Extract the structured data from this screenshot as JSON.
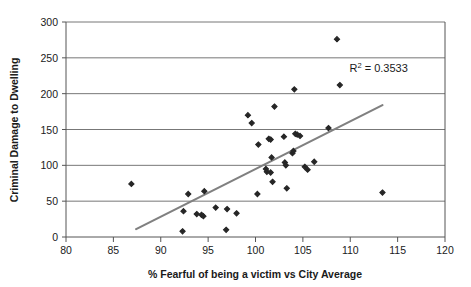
{
  "chart_data": {
    "type": "scatter",
    "title": "",
    "xlabel": "% Fearful of being a victim vs City Average",
    "ylabel": "Criminal Damage to Dwelling",
    "xlim": [
      80,
      120
    ],
    "ylim": [
      0,
      300
    ],
    "xticks": [
      80,
      85,
      90,
      95,
      100,
      105,
      110,
      115,
      120
    ],
    "yticks": [
      0,
      50,
      100,
      150,
      200,
      250,
      300
    ],
    "grid": "horizontal",
    "legend": "none",
    "annotations": [
      {
        "name": "r-squared",
        "text": "R2 = 0.3533",
        "display_prefix": "R",
        "display_sup": "2",
        "display_suffix": " = 0.3533",
        "value": 0.3533,
        "x": 113.0,
        "y": 230
      }
    ],
    "series": [
      {
        "name": "Wards",
        "marker": "diamond",
        "color": "#262626",
        "points": [
          [
            86.9,
            74
          ],
          [
            92.3,
            8
          ],
          [
            92.4,
            36
          ],
          [
            92.9,
            60
          ],
          [
            93.8,
            32
          ],
          [
            94.3,
            31
          ],
          [
            94.5,
            29
          ],
          [
            94.6,
            64
          ],
          [
            95.8,
            41
          ],
          [
            96.9,
            10
          ],
          [
            97.0,
            39
          ],
          [
            98.0,
            33
          ],
          [
            99.2,
            170
          ],
          [
            99.6,
            159
          ],
          [
            100.2,
            60
          ],
          [
            100.3,
            129
          ],
          [
            101.1,
            95
          ],
          [
            101.2,
            91
          ],
          [
            101.4,
            137
          ],
          [
            101.6,
            136
          ],
          [
            101.6,
            90
          ],
          [
            101.7,
            111
          ],
          [
            101.8,
            77
          ],
          [
            102.0,
            182
          ],
          [
            103.0,
            140
          ],
          [
            103.1,
            104
          ],
          [
            103.2,
            100
          ],
          [
            103.3,
            68
          ],
          [
            103.9,
            117
          ],
          [
            104.0,
            120
          ],
          [
            104.1,
            206
          ],
          [
            104.2,
            144
          ],
          [
            104.4,
            143
          ],
          [
            104.7,
            141
          ],
          [
            105.2,
            98
          ],
          [
            105.5,
            94
          ],
          [
            106.2,
            105
          ],
          [
            107.7,
            152
          ],
          [
            108.6,
            276
          ],
          [
            108.9,
            212
          ],
          [
            113.4,
            62
          ]
        ]
      }
    ],
    "trendline": {
      "name": "linear-trendline",
      "color": "#808080",
      "x_start": 87.4,
      "y_start": 11,
      "x_end": 113.4,
      "y_end": 184
    }
  },
  "axis": {
    "x_title": "% Fearful of being a victim vs City Average",
    "y_title": "Criminal Damage to Dwelling"
  }
}
